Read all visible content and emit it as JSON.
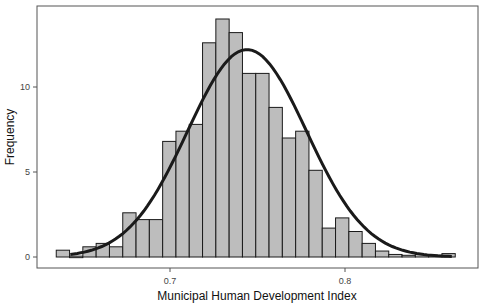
{
  "chart_data": {
    "type": "bar",
    "subtype": "histogram_with_normal_curve",
    "title": "",
    "xlabel": "Municipal Human Development Index",
    "ylabel": "Frequency",
    "x_ticks": [
      0.7,
      0.8
    ],
    "x_tick_labels": [
      "0.7",
      "0.8"
    ],
    "y_ticks": [
      0,
      5,
      10
    ],
    "y_tick_labels": [
      "0",
      "5",
      "10"
    ],
    "xlim": [
      0.585,
      0.87
    ],
    "ylim": [
      -0.65,
      14.8
    ],
    "grid": false,
    "legend": null,
    "bin_width": 0.0076,
    "bins_start": 0.635,
    "values": [
      0.4,
      0.05,
      0.6,
      0.8,
      0.6,
      2.6,
      2.2,
      2.2,
      6.8,
      7.4,
      7.8,
      12.6,
      14.0,
      13.2,
      10.8,
      10.8,
      8.8,
      7.0,
      7.4,
      5.1,
      1.7,
      2.3,
      1.5,
      0.8,
      0.35,
      0.15,
      0.1,
      0.15,
      0.1,
      0.2
    ],
    "normal_curve": {
      "mean": 0.744,
      "sd": 0.034,
      "peak_frequency": 12.2
    },
    "bar_fill": "#bdbdbd",
    "bar_stroke": "#1a1a1a",
    "curve_color": "#1a1a1a"
  }
}
